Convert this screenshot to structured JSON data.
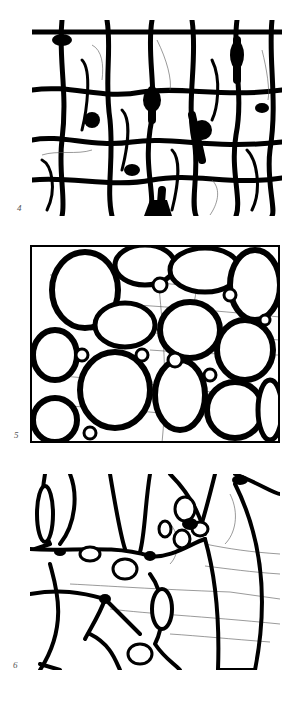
{
  "figure": {
    "panels": [
      {
        "id": "4",
        "label": "4",
        "description": "dense irregular cellular network with thick dark walls"
      },
      {
        "id": "5",
        "label": "5",
        "description": "rounded polygonal cells with thick walls and fine horizontal striations"
      },
      {
        "id": "6",
        "label": "6",
        "description": "large elongated cells with thinner walls and horizontal fine lines"
      }
    ]
  }
}
